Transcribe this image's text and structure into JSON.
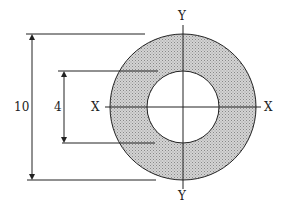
{
  "diagram": {
    "outer_dimension_label": "10",
    "inner_dimension_label": "4",
    "x_axis_labels": [
      "X",
      "X"
    ],
    "y_axis_labels": [
      "Y",
      "Y"
    ],
    "colors": {
      "ring_fill": "#c8c8c8",
      "line": "#222222"
    }
  }
}
